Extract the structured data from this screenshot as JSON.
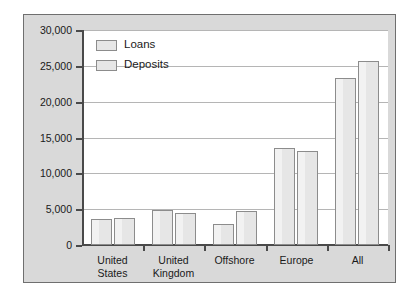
{
  "chart_data": {
    "type": "bar",
    "title": "",
    "subtitle": "",
    "xlabel": "",
    "ylabel": "",
    "categories": [
      "United States",
      "United Kingdom",
      "Offshore",
      "Europe",
      "All"
    ],
    "category_lines": [
      [
        "United",
        "States"
      ],
      [
        "United",
        "Kingdom"
      ],
      [
        "Offshore"
      ],
      [
        "Europe"
      ],
      [
        "All"
      ]
    ],
    "series": [
      {
        "name": "Loans",
        "values": [
          3600,
          4900,
          2950,
          13500,
          23300
        ]
      },
      {
        "name": "Deposits",
        "values": [
          3800,
          4400,
          4700,
          13100,
          25700
        ]
      }
    ],
    "ylim": [
      0,
      30000
    ],
    "ytick_values": [
      0,
      5000,
      10000,
      15000,
      20000,
      25000,
      30000
    ],
    "ytick_labels": [
      "0",
      "5,000",
      "10,000",
      "15,000",
      "20,000",
      "25,000",
      "30,000"
    ],
    "grid": true,
    "grid_axis": "y",
    "legend_position": "top-left",
    "colors": {
      "bar_fill": "#e6e6e6",
      "bar_border": "#8c8c8c",
      "plot_background": "#ffffff",
      "panel_background": "#d9d9d9",
      "panel_border": "#6f6f6f",
      "gridline": "#b5b5b5",
      "axis": "#4a4a4a",
      "text": "#1a1a1a"
    }
  },
  "legend": {
    "items": [
      {
        "label": "Loans"
      },
      {
        "label": "Deposits"
      }
    ]
  }
}
